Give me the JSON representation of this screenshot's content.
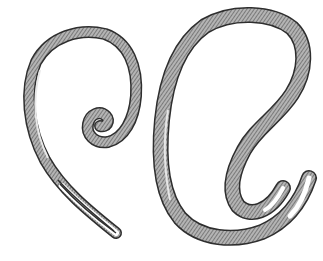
{
  "image": {
    "subject": "Engraved illustration of two coiled nematode worms",
    "background_color": "#ffffff",
    "ink_color": "#3a3a3a",
    "body_fill": "#9a9a9a"
  },
  "figures": [
    {
      "name": "left-worm",
      "shape": "spiral coil with tapering tail"
    },
    {
      "name": "right-worm",
      "shape": "large loop with hooked tail ends"
    }
  ]
}
